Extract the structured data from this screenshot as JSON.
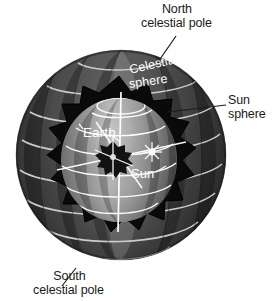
{
  "figure": {
    "type": "astronomy-diagram",
    "background_color": "#ffffff"
  },
  "labels": {
    "north_pole": {
      "line1": "North",
      "line2": "celestial pole"
    },
    "sun_sphere": {
      "line1": "Sun",
      "line2": "sphere"
    },
    "south_pole": {
      "line1": "South",
      "line2": "celestial pole"
    },
    "celestial_sphere": {
      "word1": "Celestial",
      "word2": "sphere"
    },
    "earth": {
      "text": "Earth"
    },
    "sun": {
      "text": "Sun"
    }
  },
  "colors": {
    "label_text": "#1a1a1a",
    "inner_label_text": "#ffffff",
    "outer_sphere_dark": "#343434",
    "outer_sphere_mid": "#4a4a4a",
    "outer_sphere_light": "#6e6e6e",
    "cutaway_black": "#0a0a0a",
    "inner_sphere_light": "#b4b4b4",
    "inner_sphere_dark": "#5a5a5a",
    "grid_line": "#d2d2d2",
    "inner_grid_line": "#ffffff",
    "leader_line": "#1a1a1a",
    "earth_body": "#141414",
    "sun_glyph": "#ffffff"
  },
  "geometry": {
    "outer_sphere": {
      "cx": 121,
      "cy": 155,
      "r": 105
    },
    "inner_sphere": {
      "cx": 119,
      "cy": 160,
      "rx": 58,
      "ry": 62
    },
    "earth": {
      "cx": 113,
      "cy": 155,
      "r": 14
    },
    "sun": {
      "cx": 152,
      "cy": 152,
      "r": 9
    }
  }
}
